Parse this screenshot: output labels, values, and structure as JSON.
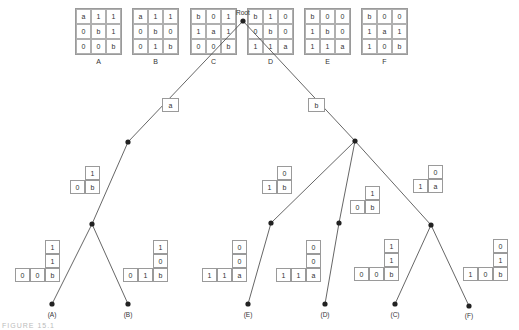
{
  "boards": [
    {
      "label": "A",
      "cells": [
        [
          "a",
          "1",
          "1"
        ],
        [
          "0",
          "b",
          "1"
        ],
        [
          "0",
          "0",
          "b"
        ]
      ]
    },
    {
      "label": "B",
      "cells": [
        [
          "a",
          "1",
          "1"
        ],
        [
          "0",
          "b",
          "0"
        ],
        [
          "0",
          "1",
          "b"
        ]
      ]
    },
    {
      "label": "C",
      "cells": [
        [
          "b",
          "0",
          "1"
        ],
        [
          "1",
          "a",
          "1"
        ],
        [
          "0",
          "0",
          "b"
        ]
      ]
    },
    {
      "label": "D",
      "cells": [
        [
          "b",
          "1",
          "0"
        ],
        [
          "0",
          "b",
          "0"
        ],
        [
          "1",
          "1",
          "a"
        ]
      ]
    },
    {
      "label": "E",
      "cells": [
        [
          "b",
          "0",
          "0"
        ],
        [
          "1",
          "b",
          "0"
        ],
        [
          "1",
          "1",
          "a"
        ]
      ]
    },
    {
      "label": "F",
      "cells": [
        [
          "b",
          "0",
          "0"
        ],
        [
          "1",
          "a",
          "1"
        ],
        [
          "1",
          "0",
          "b"
        ]
      ]
    }
  ],
  "tree": {
    "root_label": "Root",
    "edge_labels": {
      "left": "a",
      "right": "b"
    },
    "partials": {
      "left_l1": {
        "top": "1",
        "left": "0",
        "corner": "b"
      },
      "right_e": {
        "top": "0",
        "left": "1",
        "corner": "b"
      },
      "right_d": {
        "top": "1",
        "left": "0",
        "corner": "b"
      },
      "right_f": {
        "top": "0",
        "left": "1",
        "corner": "a"
      }
    },
    "leaf_paths": {
      "A": {
        "col": [
          "1",
          "1"
        ],
        "row": [
          "0",
          "0"
        ],
        "corner": "b"
      },
      "B": {
        "col": [
          "1",
          "0"
        ],
        "row": [
          "0",
          "1"
        ],
        "corner": "b"
      },
      "E": {
        "col": [
          "0",
          "0"
        ],
        "row": [
          "1",
          "1"
        ],
        "corner": "a"
      },
      "D": {
        "col": [
          "0",
          "0"
        ],
        "row": [
          "1",
          "1"
        ],
        "corner": "a"
      },
      "C": {
        "col": [
          "1",
          "1"
        ],
        "row": [
          "0",
          "0"
        ],
        "corner": "b"
      },
      "F": {
        "col": [
          "0",
          "1"
        ],
        "row": [
          "1",
          "0"
        ],
        "corner": "b"
      }
    },
    "leaves": [
      "(A)",
      "(B)",
      "(E)",
      "(D)",
      "(C)",
      "(F)"
    ]
  },
  "caption": "FIGURE 15.1"
}
